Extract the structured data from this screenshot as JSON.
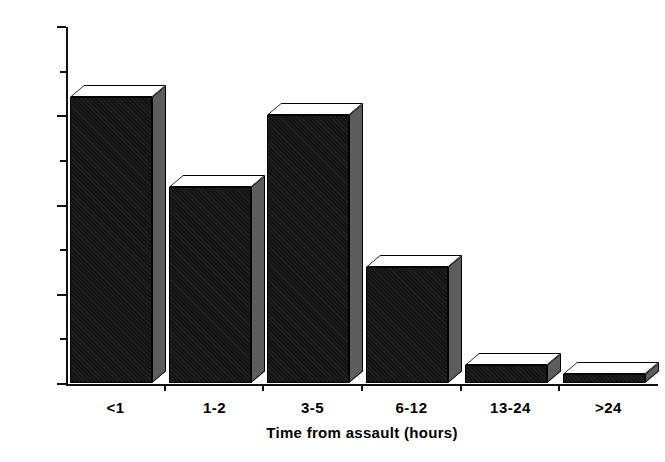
{
  "chart_data": {
    "type": "bar",
    "title": "",
    "subtitle": "",
    "xlabel": "Time from assault (hours)",
    "ylabel": "% Total",
    "categories": [
      "<1",
      "1-2",
      "3-5",
      "6-12",
      "13-24",
      ">24"
    ],
    "values": [
      32,
      22,
      30,
      13,
      2,
      1
    ],
    "ylim": [
      0,
      40
    ],
    "ytick_labels": [
      "0",
      "10",
      "20",
      "30",
      "40"
    ],
    "ytick_values": [
      0,
      10,
      20,
      30,
      40
    ],
    "yminor_tick_values": [
      5,
      15,
      25,
      35
    ],
    "grid": false,
    "legend": false,
    "legend_position": "none",
    "bar_style": "3d-block",
    "colors": {
      "bar_front": "#141414",
      "bar_top": "#ffffff",
      "bar_side": "#5d5d5d",
      "axis": "#111111",
      "background": "#ffffff",
      "text": "#000000"
    }
  }
}
